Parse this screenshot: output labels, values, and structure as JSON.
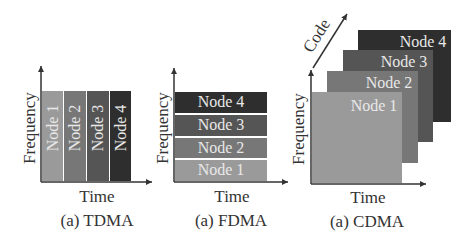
{
  "colors": {
    "node1": "#9a9a9a",
    "node2": "#777777",
    "node3": "#555555",
    "node4": "#2e2e2e",
    "axis": "#333333"
  },
  "panels": [
    {
      "id": "tdma",
      "caption": "(a) TDMA",
      "x_axis_label": "Time",
      "y_axis_label": "Frequency",
      "blocks": [
        {
          "label": "Node 1"
        },
        {
          "label": "Node 2"
        },
        {
          "label": "Node 3"
        },
        {
          "label": "Node 4"
        }
      ]
    },
    {
      "id": "fdma",
      "caption": "(a) FDMA",
      "x_axis_label": "Time",
      "y_axis_label": "Frequency",
      "blocks": [
        {
          "label": "Node 1"
        },
        {
          "label": "Node 2"
        },
        {
          "label": "Node 3"
        },
        {
          "label": "Node 4"
        }
      ]
    },
    {
      "id": "cdma",
      "caption": "(a) CDMA",
      "x_axis_label": "Time",
      "y_axis_label": "Frequency",
      "z_axis_label": "Code",
      "blocks": [
        {
          "label": "Node 1"
        },
        {
          "label": "Node 2"
        },
        {
          "label": "Node 3"
        },
        {
          "label": "Node 4"
        }
      ]
    }
  ]
}
